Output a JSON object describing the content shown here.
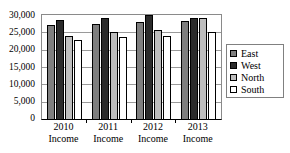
{
  "chart_data": {
    "type": "bar",
    "title": "",
    "subtitle": "",
    "xlabel": "",
    "ylabel": "",
    "categories": [
      "2010 Income",
      "2011 Income",
      "2012 Income",
      "2013 Income"
    ],
    "category_lines": [
      [
        "2010",
        "Income"
      ],
      [
        "2011",
        "Income"
      ],
      [
        "2012",
        "Income"
      ],
      [
        "2013",
        "Income"
      ]
    ],
    "series": [
      {
        "name": "East",
        "color": "#7f7f7f",
        "values": [
          27000,
          27500,
          28000,
          28300
        ]
      },
      {
        "name": "West",
        "color": "#2b2b2b",
        "values": [
          28600,
          29000,
          30000,
          29000
        ]
      },
      {
        "name": "North",
        "color": "#bdbdbd",
        "values": [
          24000,
          25000,
          25800,
          29000
        ]
      },
      {
        "name": "South",
        "color": "#ffffff",
        "values": [
          22800,
          23700,
          23900,
          25000
        ]
      }
    ],
    "ylim": [
      0,
      30000
    ],
    "ytick_values": [
      30000,
      25000,
      20000,
      15000,
      10000,
      5000,
      0
    ],
    "ytick_labels": [
      "30,000",
      "25,000",
      "20,000",
      "15,000",
      "10,000",
      "5,000",
      "0"
    ],
    "grid": true,
    "grid_axis": "y",
    "legend": [
      "East",
      "West",
      "North",
      "South"
    ],
    "legend_position": "right",
    "plot_border_color": "#8a8a8a",
    "gridline_color": "#9a9a9a",
    "background_color": "#ffffff"
  },
  "legend": {
    "items": [
      {
        "label": "East"
      },
      {
        "label": "West"
      },
      {
        "label": "North"
      },
      {
        "label": "South"
      }
    ]
  }
}
